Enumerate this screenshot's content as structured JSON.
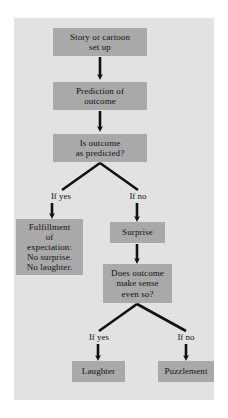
{
  "diagram": {
    "panel_color": "#e2e2e2",
    "node_color": "#a9a9a9",
    "line_color": "#111111",
    "nodes": {
      "story": "Story or cartoon\nset up",
      "prediction": "Prediction of\noutcome",
      "is_outcome_as_predicted": "Is outcome\nas predicted?",
      "fulfillment": "Fulfillment\nof\nexpectation:\nNo surprise.\nNo laughter.",
      "surprise": "Surprise",
      "does_outcome_make_sense": "Does outcome\nmake sense\neven so?",
      "laughter": "Laughter",
      "puzzlement": "Puzzlement"
    },
    "edge_labels": {
      "yes_branch_1": "If yes",
      "no_branch_1": "If no",
      "yes_branch_2": "If yes",
      "no_branch_2": "If no"
    }
  }
}
